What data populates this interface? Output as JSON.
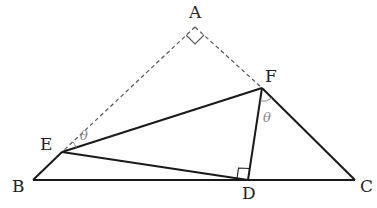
{
  "diagram": {
    "type": "geometry",
    "labels": {
      "A": "A",
      "B": "B",
      "C": "C",
      "D": "D",
      "E": "E",
      "F": "F",
      "theta_E": "θ",
      "theta_F": "θ"
    },
    "points": {
      "A": [
        195,
        27
      ],
      "B": [
        33,
        180
      ],
      "C": [
        355,
        180
      ],
      "D": [
        248,
        180
      ],
      "E": [
        62,
        152
      ],
      "F": [
        262,
        88
      ]
    },
    "segments_solid": [
      "B-C",
      "B-E",
      "E-F",
      "E-D",
      "F-D",
      "F-C"
    ],
    "segments_dashed": [
      "A-E",
      "A-F"
    ],
    "right_angles": [
      "A",
      "D"
    ],
    "angle_marks": [
      {
        "vertex": "E",
        "between": [
          "A",
          "F"
        ],
        "label": "θ"
      },
      {
        "vertex": "F",
        "between": [
          "E",
          "D"
        ],
        "label": "θ"
      }
    ],
    "colors": {
      "line": "#1a1a1a",
      "dashed": "#555555",
      "theta": "#888888"
    }
  }
}
